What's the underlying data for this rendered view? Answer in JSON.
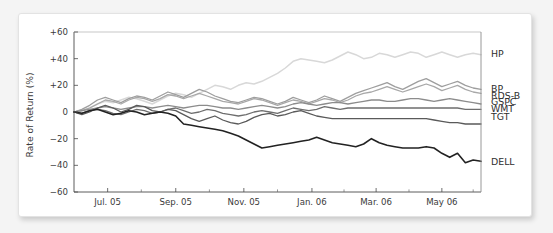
{
  "figure": {
    "background_color": "#f4f4f4",
    "card_color": "#ffffff",
    "border_color": "#e3e3e3"
  },
  "chart_data": {
    "type": "line",
    "title": "",
    "subtitle": "",
    "xlabel": "",
    "ylabel": "Rate of Return (%)",
    "ylim": [
      -60,
      60
    ],
    "yticks": [
      60,
      40,
      20,
      0,
      -20,
      -40,
      -60
    ],
    "ytick_labels": [
      "+60",
      "+40",
      "+20",
      "0",
      "−20",
      "−40",
      "−60"
    ],
    "xlim": [
      0,
      52
    ],
    "xtick_labels": [
      "Jul. 05",
      "Sep. 05",
      "Nov. 05",
      "Jan. 06",
      "Mar. 06",
      "May 06"
    ],
    "xtick_positions": [
      4.3,
      13.0,
      21.7,
      30.4,
      38.6,
      47.0
    ],
    "xminor_positions": [
      8.6,
      17.3,
      26.0,
      34.5,
      42.8,
      51.0
    ],
    "grid": false,
    "legend_position": "right",
    "x_unit": "week",
    "series": [
      {
        "name": "HP",
        "color": "#d8d8d8",
        "width": 1.5,
        "label_y": 43,
        "values": [
          0,
          1,
          3,
          6,
          8,
          7,
          9,
          11,
          10,
          8,
          6,
          9,
          12,
          14,
          13,
          11,
          14,
          17,
          20,
          19,
          17,
          20,
          22,
          21,
          23,
          26,
          29,
          33,
          38,
          40,
          39,
          38,
          37,
          39,
          42,
          45,
          43,
          40,
          41,
          44,
          43,
          41,
          43,
          45,
          44,
          41,
          43,
          45,
          43,
          41,
          43,
          44,
          43
        ]
      },
      {
        "name": "BP",
        "color": "#9e9e9e",
        "width": 1.3,
        "label_y": 17,
        "values": [
          0,
          2,
          5,
          9,
          11,
          9,
          7,
          10,
          12,
          11,
          9,
          12,
          15,
          13,
          11,
          14,
          17,
          15,
          12,
          10,
          8,
          7,
          9,
          11,
          10,
          8,
          6,
          8,
          11,
          9,
          7,
          9,
          12,
          10,
          8,
          11,
          14,
          16,
          18,
          20,
          22,
          19,
          17,
          20,
          23,
          25,
          22,
          19,
          21,
          23,
          20,
          18,
          17
        ]
      },
      {
        "name": "RDS-B",
        "color": "#a8a8a8",
        "width": 1.3,
        "label_y": 12,
        "values": [
          0,
          1,
          3,
          6,
          9,
          8,
          6,
          9,
          11,
          10,
          8,
          10,
          13,
          12,
          10,
          12,
          14,
          12,
          10,
          8,
          7,
          6,
          8,
          10,
          9,
          7,
          5,
          7,
          9,
          8,
          6,
          8,
          10,
          9,
          7,
          9,
          12,
          14,
          15,
          17,
          19,
          17,
          15,
          17,
          19,
          21,
          19,
          16,
          18,
          20,
          17,
          15,
          14
        ]
      },
      {
        "name": "GSPC",
        "color": "#8c8c8c",
        "width": 1.3,
        "label_y": 7,
        "values": [
          0,
          1,
          2,
          3,
          4,
          3,
          2,
          3,
          4,
          4,
          3,
          4,
          5,
          4,
          3,
          4,
          5,
          5,
          4,
          3,
          3,
          2,
          3,
          4,
          5,
          4,
          3,
          4,
          6,
          7,
          6,
          5,
          6,
          7,
          7,
          6,
          7,
          8,
          9,
          9,
          8,
          8,
          9,
          10,
          10,
          9,
          8,
          9,
          10,
          9,
          8,
          7,
          6
        ]
      },
      {
        "name": "WMT",
        "color": "#6e6e6e",
        "width": 1.3,
        "label_y": 2,
        "values": [
          0,
          -1,
          1,
          2,
          1,
          -1,
          -2,
          0,
          2,
          1,
          -1,
          0,
          2,
          3,
          1,
          -1,
          0,
          2,
          1,
          -1,
          -2,
          -3,
          -2,
          0,
          1,
          0,
          -1,
          1,
          3,
          2,
          1,
          2,
          4,
          3,
          2,
          3,
          3,
          3,
          3,
          3,
          3,
          3,
          3,
          3,
          3,
          3,
          3,
          3,
          3,
          3,
          2,
          2,
          2
        ]
      },
      {
        "name": "TGT",
        "color": "#5a5a5a",
        "width": 1.3,
        "label_y": -4,
        "values": [
          0,
          -2,
          0,
          3,
          5,
          3,
          0,
          2,
          5,
          4,
          1,
          0,
          2,
          1,
          -2,
          -5,
          -7,
          -5,
          -3,
          -6,
          -8,
          -9,
          -7,
          -4,
          -2,
          -1,
          -3,
          -2,
          0,
          1,
          -1,
          -3,
          -4,
          -5,
          -5,
          -5,
          -5,
          -5,
          -5,
          -5,
          -5,
          -5,
          -5,
          -5,
          -5,
          -5,
          -6,
          -7,
          -8,
          -8,
          -9,
          -9,
          -9
        ]
      },
      {
        "name": "DELL",
        "color": "#222222",
        "width": 1.6,
        "label_y": -38,
        "values": [
          0,
          -1,
          1,
          2,
          0,
          -2,
          -1,
          1,
          0,
          -2,
          -1,
          0,
          -1,
          -3,
          -9,
          -10,
          -11,
          -12,
          -13,
          -14,
          -16,
          -18,
          -21,
          -24,
          -27,
          -26,
          -25,
          -24,
          -23,
          -22,
          -21,
          -19,
          -21,
          -23,
          -24,
          -25,
          -26,
          -24,
          -20,
          -23,
          -25,
          -26,
          -27,
          -27,
          -27,
          -26,
          -27,
          -31,
          -34,
          -31,
          -38,
          -36,
          -37
        ]
      }
    ]
  }
}
